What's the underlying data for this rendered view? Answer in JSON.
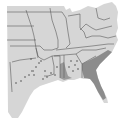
{
  "map": {
    "type": "species-range-map",
    "region": "Southeastern United States",
    "colors": {
      "background": "#ffffff",
      "land": "#d6d6d6",
      "border": "#5a5a5a",
      "range_dense": "#8c8c8c",
      "range_sparse": "#a6a6a6",
      "water": "#ffffff"
    },
    "labels": {
      "caption": "Range map"
    }
  }
}
